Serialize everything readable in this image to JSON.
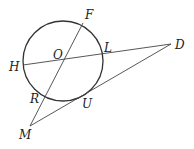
{
  "diagram": {
    "type": "geometry",
    "colors": {
      "stroke": "#333333",
      "label": "#222222",
      "background": "#ffffff"
    },
    "circle": {
      "center_label": "O",
      "cx": 63,
      "cy": 61,
      "r": 40
    },
    "points": {
      "F": {
        "label": "F",
        "x": 83,
        "y": 23
      },
      "O": {
        "label": "O",
        "x": 63,
        "y": 61
      },
      "L": {
        "label": "L",
        "x": 102,
        "y": 56
      },
      "D": {
        "label": "D",
        "x": 171,
        "y": 44
      },
      "H": {
        "label": "H",
        "x": 23,
        "y": 65
      },
      "R": {
        "label": "R",
        "x": 46,
        "y": 95
      },
      "U": {
        "label": "U",
        "x": 80,
        "y": 99
      },
      "M": {
        "label": "M",
        "x": 30,
        "y": 126
      }
    },
    "segments": [
      {
        "from": "F",
        "to": "M",
        "note": "line through F, O, R, M"
      },
      {
        "from": "H",
        "to": "D",
        "note": "line through H, O, L, D"
      },
      {
        "from": "M",
        "to": "D",
        "note": "tangent at U"
      }
    ],
    "labels": {
      "F": "F",
      "O": "O",
      "L": "L",
      "D": "D",
      "H": "H",
      "R": "R",
      "U": "U",
      "M": "M"
    }
  }
}
